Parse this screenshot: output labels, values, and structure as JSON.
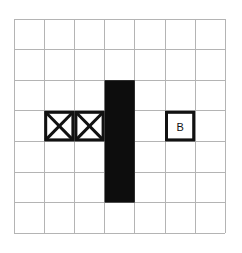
{
  "figure": {
    "title": "",
    "background_color": "#ffffff",
    "grid": {
      "rows": 7,
      "cols": 7,
      "origin_x": 14,
      "origin_y": 19,
      "cell_width": 30.2,
      "cell_height": 30.6,
      "line_color": "#b4b4b4",
      "line_width": 1
    },
    "shapes": [
      {
        "kind": "filled-rect",
        "name": "black-wall-bar",
        "col": 3,
        "row": 2,
        "col_span": 1,
        "row_span": 4,
        "fill_color": "#0d0d0d",
        "label": ""
      },
      {
        "kind": "cross-box",
        "name": "cross-box-left",
        "col": 1,
        "row": 3,
        "col_span": 1,
        "row_span": 1,
        "stroke_color": "#111111",
        "stroke_width": 3,
        "fill_color": "#ffffff",
        "label": ""
      },
      {
        "kind": "cross-box",
        "name": "cross-box-right",
        "col": 2,
        "row": 3,
        "col_span": 1,
        "row_span": 1,
        "stroke_color": "#111111",
        "stroke_width": 3,
        "fill_color": "#ffffff",
        "label": ""
      },
      {
        "kind": "label-box",
        "name": "label-box-b",
        "col": 5,
        "row": 3,
        "col_span": 1,
        "row_span": 1,
        "stroke_color": "#111111",
        "stroke_width": 3,
        "fill_color": "#ffffff",
        "label": "B"
      }
    ]
  },
  "labels": {
    "box_b": "B"
  }
}
